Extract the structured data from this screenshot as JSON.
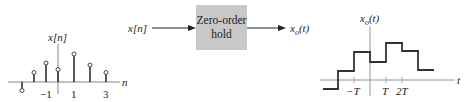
{
  "left_plot": {
    "y_label": "x[n]",
    "x_axis_label": "n",
    "tick_labels": [
      "−1",
      "1",
      "3"
    ],
    "samples": [
      {
        "n": -4,
        "value": -0.8
      },
      {
        "n": -3,
        "value": 1.0
      },
      {
        "n": -2,
        "value": 1.9
      },
      {
        "n": -1,
        "value": 1.3
      },
      {
        "n": 1,
        "value": 2.8
      },
      {
        "n": 2,
        "value": 1.7
      },
      {
        "n": 3,
        "value": 1.0
      }
    ]
  },
  "block": {
    "input_label": "x[n]",
    "title_line1": "Zero-order",
    "title_line2": "hold",
    "output_label": "x",
    "output_subscript": "o",
    "output_arg": "(t)",
    "fill_color": "#c8c8c8"
  },
  "right_plot": {
    "y_label_main": "x",
    "y_label_sub": "o",
    "y_label_arg": "(t)",
    "x_axis_label": "t",
    "tick_labels": [
      "−T",
      "T",
      "2T"
    ],
    "steps_description": "zero-order hold staircase reconstruction of x[n]"
  }
}
